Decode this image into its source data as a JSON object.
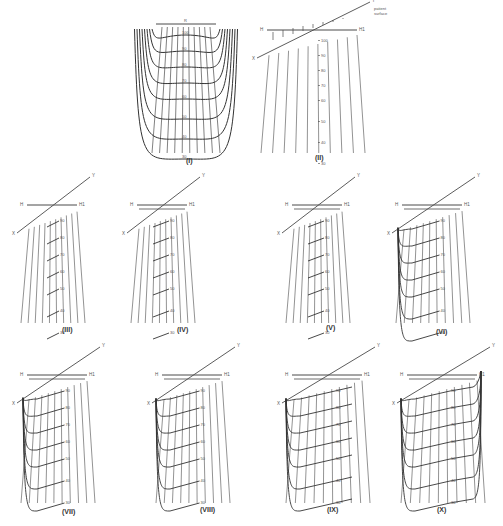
{
  "figure": {
    "stroke_color": "#4a4a4a",
    "curve_color": "#333333",
    "background": "#ffffff"
  },
  "panels": [
    {
      "id": "I",
      "label": "(I)",
      "x": 120,
      "y": 0,
      "w": 120,
      "h": 165,
      "label_y": 163,
      "label_x": 186,
      "type": "symmetric",
      "dose_labels": [
        "100",
        "90",
        "80",
        "70",
        "60",
        "50",
        "40",
        "30"
      ],
      "annotations": {
        "top": "R"
      }
    },
    {
      "id": "II",
      "label": "(II)",
      "x": 255,
      "y": 0,
      "w": 120,
      "h": 165,
      "label_y": 160,
      "label_x": 315,
      "type": "oblique-unmodified",
      "dose_labels": [
        "100",
        "90",
        "80",
        "70",
        "60",
        "50",
        "40",
        "30"
      ],
      "axis_labels": {
        "H": "H",
        "H1": "H1",
        "X": "X",
        "Y": "Y"
      },
      "annotations": {
        "surface": [
          "patient",
          "surface"
        ]
      }
    },
    {
      "id": "III",
      "label": "(III)",
      "x": 15,
      "y": 175,
      "w": 80,
      "h": 160,
      "label_y": 332,
      "label_x": 62,
      "type": "oblique-shift",
      "step": 0,
      "dose_labels": [
        "90",
        "80",
        "70",
        "60",
        "50",
        "40",
        "30"
      ],
      "axis_labels": {
        "H": "H",
        "H1": "H1",
        "X": "X",
        "Y": "Y"
      }
    },
    {
      "id": "IV",
      "label": "(IV)",
      "x": 125,
      "y": 175,
      "w": 80,
      "h": 160,
      "label_y": 332,
      "label_x": 177,
      "type": "oblique-shift",
      "step": 1,
      "dose_labels": [
        "90",
        "80",
        "70",
        "60",
        "50",
        "40",
        "30"
      ],
      "axis_labels": {
        "H": "H",
        "H1": "H1",
        "X": "X",
        "Y": "Y"
      }
    },
    {
      "id": "V",
      "label": "(V)",
      "x": 280,
      "y": 175,
      "w": 80,
      "h": 160,
      "label_y": 330,
      "label_x": 326,
      "type": "oblique-shift",
      "step": 2,
      "dose_labels": [
        "90",
        "80",
        "70",
        "60",
        "50",
        "40",
        "30"
      ],
      "axis_labels": {
        "H": "H",
        "H1": "H1",
        "X": "X",
        "Y": "Y"
      }
    },
    {
      "id": "VI",
      "label": "(VI)",
      "x": 390,
      "y": 175,
      "w": 90,
      "h": 160,
      "label_y": 334,
      "label_x": 436,
      "type": "oblique-curves",
      "step": 3,
      "dose_labels": [
        "90",
        "80",
        "70",
        "60",
        "50",
        "40",
        "30"
      ],
      "axis_labels": {
        "H": "H",
        "H1": "H1",
        "X": "X",
        "Y": "Y"
      }
    },
    {
      "id": "VII",
      "label": "(VII)",
      "x": 15,
      "y": 345,
      "w": 90,
      "h": 170,
      "label_y": 514,
      "label_x": 62,
      "type": "oblique-curves",
      "step": 4,
      "dose_labels": [
        "90",
        "80",
        "70",
        "60",
        "50",
        "40",
        "30"
      ],
      "axis_labels": {
        "H": "H",
        "H1": "H1",
        "X": "X",
        "Y": "Y"
      }
    },
    {
      "id": "VIII",
      "label": "(VIII)",
      "x": 150,
      "y": 345,
      "w": 90,
      "h": 170,
      "label_y": 512,
      "label_x": 200,
      "type": "oblique-curves",
      "step": 5,
      "dose_labels": [
        "90",
        "80",
        "70",
        "60",
        "50",
        "40",
        "30"
      ],
      "axis_labels": {
        "H": "H",
        "H1": "H1",
        "X": "X",
        "Y": "Y"
      }
    },
    {
      "id": "IX",
      "label": "(IX)",
      "x": 280,
      "y": 345,
      "w": 100,
      "h": 170,
      "label_y": 512,
      "label_x": 327,
      "type": "oblique-full",
      "step": 6,
      "dose_labels": [
        "90",
        "80",
        "70",
        "60",
        "50",
        "40",
        "30"
      ],
      "axis_labels": {
        "H": "H",
        "H1": "H1",
        "X": "X",
        "Y": "Y"
      }
    },
    {
      "id": "X",
      "label": "(X)",
      "x": 395,
      "y": 345,
      "w": 100,
      "h": 170,
      "label_y": 512,
      "label_x": 437,
      "type": "oblique-full-both",
      "step": 7,
      "dose_labels": [
        "90",
        "80",
        "70",
        "60",
        "50",
        "40",
        "30"
      ],
      "axis_labels": {
        "H": "H",
        "H1": "H1",
        "X": "X",
        "Y": "Y"
      }
    }
  ]
}
